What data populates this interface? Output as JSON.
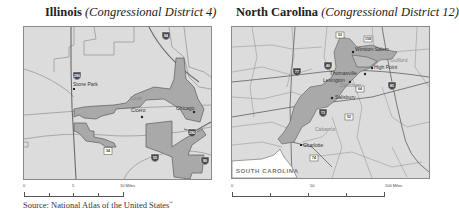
{
  "maps": [
    {
      "id": "illinois",
      "title_state": "Illinois",
      "title_district": "(Congressional District 4)",
      "district_fill": "#a9a9a9",
      "background": "#dcdcdc",
      "places": [
        {
          "name": "Stone Park",
          "type": "city"
        },
        {
          "name": "Cicero",
          "type": "city"
        },
        {
          "name": "Chicago",
          "type": "city"
        },
        {
          "name": "Cook",
          "type": "county"
        }
      ],
      "road_shields": [
        {
          "label": "94",
          "type": "interstate"
        },
        {
          "label": "290",
          "type": "interstate"
        },
        {
          "label": "290",
          "type": "interstate"
        },
        {
          "label": "34",
          "type": "us-highway"
        },
        {
          "label": "55",
          "type": "interstate"
        },
        {
          "label": "90",
          "type": "interstate"
        }
      ],
      "scale": {
        "labels": [
          "0",
          "5",
          "10 Miles"
        ]
      }
    },
    {
      "id": "north-carolina",
      "title_state": "North Carolina",
      "title_district": "(Congressional District 12)",
      "district_fill": "#a9a9a9",
      "background": "#dcdcdc",
      "places": [
        {
          "name": "Winston-Salem",
          "type": "city"
        },
        {
          "name": "High Point",
          "type": "city"
        },
        {
          "name": "Thomasville",
          "type": "city"
        },
        {
          "name": "Lexington",
          "type": "city"
        },
        {
          "name": "Salisbury",
          "type": "city"
        },
        {
          "name": "Charlotte",
          "type": "city"
        },
        {
          "name": "Davidson",
          "type": "county"
        },
        {
          "name": "Cabarrus",
          "type": "county"
        },
        {
          "name": "Guilford",
          "type": "county"
        }
      ],
      "region_label": "SOUTH CAROLINA",
      "road_shields": [
        {
          "label": "52",
          "type": "us-highway"
        },
        {
          "label": "158",
          "type": "us-highway"
        },
        {
          "label": "77",
          "type": "interstate"
        },
        {
          "label": "40",
          "type": "interstate"
        },
        {
          "label": "85",
          "type": "interstate"
        },
        {
          "label": "64",
          "type": "us-highway"
        },
        {
          "label": "73",
          "type": "interstate"
        },
        {
          "label": "85",
          "type": "interstate"
        },
        {
          "label": "52",
          "type": "us-highway"
        },
        {
          "label": "74",
          "type": "us-highway"
        }
      ],
      "scale": {
        "labels": [
          "0",
          "50",
          "100 Miles"
        ]
      }
    }
  ],
  "source": {
    "text": "Source: National Atlas of the United States",
    "mark": "®"
  }
}
